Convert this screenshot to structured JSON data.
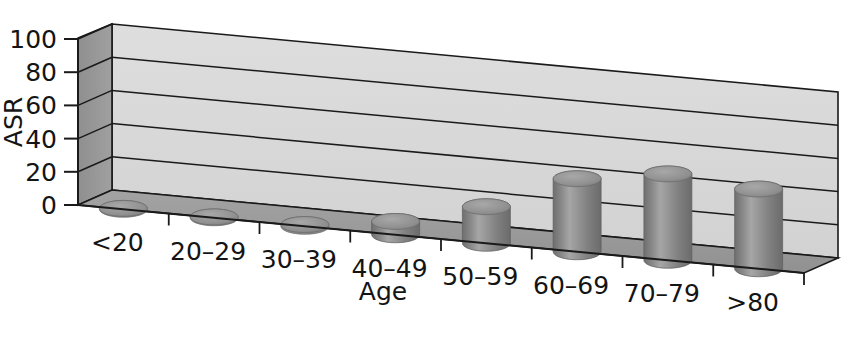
{
  "chart_data": {
    "type": "bar",
    "title": "",
    "subtitle": "",
    "xlabel": "Age",
    "ylabel": "ASR",
    "categories": [
      "<20",
      "20–29",
      "30–39",
      "40–49",
      "50–59",
      "60–69",
      "70–79",
      ">80"
    ],
    "values": [
      0.5,
      0.5,
      1,
      8,
      22,
      44,
      52,
      48
    ],
    "ylim": [
      0,
      100
    ],
    "ytick_labels": [
      "0",
      "20",
      "40",
      "60",
      "80",
      "100"
    ],
    "ytick_values": [
      0,
      20,
      40,
      60,
      80,
      100
    ],
    "grid": true,
    "legend": "none",
    "projection": "3d",
    "bar_shape": "cylinder",
    "series": [
      {
        "name": "ASR",
        "values": [
          0.5,
          0.5,
          1,
          8,
          22,
          44,
          52,
          48
        ]
      }
    ]
  },
  "colors": {
    "bar_fill": "#8c8c8c",
    "bar_highlight": "#b4b4b4",
    "bar_shadow": "#6e6e6e",
    "bar_top": "#9a9a9a",
    "back_wall": "#d9d9d9",
    "back_wall_top": "#cfcfcf",
    "left_wall": "#969696",
    "floor": "#9d9d9d",
    "floor_front": "#8f8f8f",
    "outline": "#1a1a1a",
    "text": "#141414",
    "background": "#ffffff"
  },
  "axes": {
    "y_axis_label": "ASR",
    "x_axis_label": "Age"
  }
}
